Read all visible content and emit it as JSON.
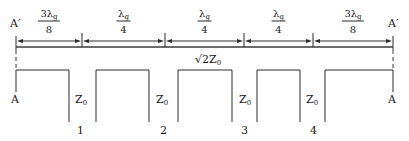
{
  "diagram": {
    "ends": {
      "top_left": "A′",
      "top_right": "A′",
      "bottom_left": "A",
      "bottom_right": "A"
    },
    "dimensions": [
      {
        "numerator": "3λ",
        "subscript": "g",
        "denominator": "8"
      },
      {
        "numerator": "λ",
        "subscript": "g",
        "denominator": "4"
      },
      {
        "numerator": "λ",
        "subscript": "g",
        "denominator": "4"
      },
      {
        "numerator": "λ",
        "subscript": "g",
        "denominator": "4"
      },
      {
        "numerator": "3λ",
        "subscript": "g",
        "denominator": "8"
      }
    ],
    "main_line_impedance": {
      "prefix": "√2Z",
      "subscript": "0"
    },
    "stubs": [
      {
        "impedance": "Z",
        "subscript": "0",
        "index": "1"
      },
      {
        "impedance": "Z",
        "subscript": "0",
        "index": "2"
      },
      {
        "impedance": "Z",
        "subscript": "0",
        "index": "3"
      },
      {
        "impedance": "Z",
        "subscript": "0",
        "index": "4"
      }
    ]
  }
}
